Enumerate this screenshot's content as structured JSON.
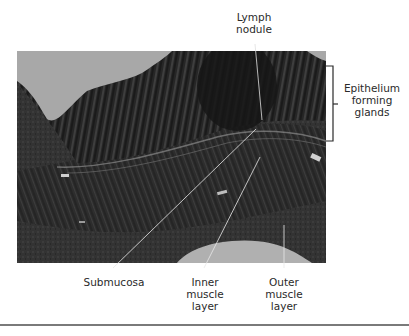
{
  "figure": {
    "type": "labeled histology micrograph",
    "labels": {
      "lymph_nodule": {
        "lines": [
          "Lymph",
          "nodule"
        ]
      },
      "epithelium": {
        "lines": [
          "Epithelium",
          "forming",
          "glands"
        ]
      },
      "submucosa": {
        "lines": [
          "Submucosa"
        ]
      },
      "inner_muscle": {
        "lines": [
          "Inner",
          "muscle",
          "layer"
        ]
      },
      "outer_muscle": {
        "lines": [
          "Outer",
          "muscle",
          "layer"
        ]
      }
    },
    "colors": {
      "background": "#ffffff",
      "lumen": "#a8a8a8",
      "tissue_dark": "#1e1e1e",
      "tissue_mid": "#3c3c3c",
      "leader_line": "#e8e8e8",
      "text": "#2a2a2a",
      "bottom_rule": "#7a7a7a"
    }
  }
}
